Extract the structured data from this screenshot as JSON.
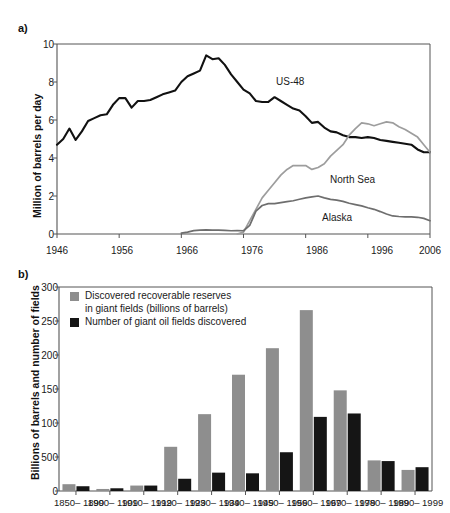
{
  "figure": {
    "panel_a_label": "a)",
    "panel_b_label": "b)"
  },
  "colors": {
    "us48": "#111111",
    "north_sea": "#9d9d9d",
    "alaska": "#6e6e6e",
    "reserves_bar": "#8e8e8e",
    "fields_bar": "#151515",
    "axis": "#555555"
  },
  "chart_data": [
    {
      "type": "line",
      "panel": "a",
      "title": "",
      "xlabel": "",
      "ylabel": "Million of barrels per day",
      "xlim": [
        1946,
        2006
      ],
      "ylim": [
        0,
        10
      ],
      "xticks": [
        1946,
        1956,
        1966,
        1976,
        1986,
        1996,
        2006
      ],
      "yticks": [
        0,
        2,
        4,
        6,
        8,
        10
      ],
      "grid": false,
      "legend_position": "inline-annotations",
      "annotations": [
        {
          "text": "US-48",
          "x": 1988,
          "y": 7.85
        },
        {
          "text": "North Sea",
          "x": 1992,
          "y": 3.45
        },
        {
          "text": "Alaska",
          "x": 1991,
          "y": 1.25
        }
      ],
      "series": [
        {
          "name": "US-48",
          "color": "#111111",
          "x": [
            1946,
            1947,
            1948,
            1949,
            1950,
            1951,
            1952,
            1953,
            1954,
            1955,
            1956,
            1957,
            1958,
            1959,
            1960,
            1961,
            1962,
            1963,
            1964,
            1965,
            1966,
            1967,
            1968,
            1969,
            1970,
            1971,
            1972,
            1973,
            1974,
            1975,
            1976,
            1977,
            1978,
            1979,
            1980,
            1981,
            1982,
            1983,
            1984,
            1985,
            1986,
            1987,
            1988,
            1989,
            1990,
            1991,
            1992,
            1993,
            1994,
            1995,
            1996,
            1997,
            1998,
            1999,
            2000,
            2001,
            2002,
            2003,
            2004,
            2005,
            2006
          ],
          "y": [
            4.7,
            5.0,
            5.55,
            4.95,
            5.4,
            5.95,
            6.1,
            6.25,
            6.3,
            6.8,
            7.15,
            7.15,
            6.65,
            7.0,
            7.0,
            7.05,
            7.2,
            7.35,
            7.45,
            7.55,
            8.0,
            8.3,
            8.45,
            8.6,
            9.4,
            9.2,
            9.25,
            8.9,
            8.4,
            8.0,
            7.6,
            7.4,
            7.0,
            6.95,
            6.95,
            7.2,
            7.0,
            6.8,
            6.6,
            6.5,
            6.2,
            5.85,
            5.9,
            5.6,
            5.4,
            5.35,
            5.2,
            5.1,
            5.1,
            5.05,
            5.1,
            5.05,
            4.95,
            4.9,
            4.85,
            4.8,
            4.75,
            4.7,
            4.45,
            4.3,
            4.3
          ]
        },
        {
          "name": "North Sea",
          "color": "#9d9d9d",
          "x": [
            1975,
            1976,
            1977,
            1978,
            1979,
            1980,
            1981,
            1982,
            1983,
            1984,
            1985,
            1986,
            1987,
            1988,
            1989,
            1990,
            1991,
            1992,
            1993,
            1994,
            1995,
            1996,
            1997,
            1998,
            1999,
            2000,
            2001,
            2002,
            2003,
            2004,
            2005,
            2006
          ],
          "y": [
            0.0,
            0.1,
            0.7,
            1.3,
            1.9,
            2.3,
            2.7,
            3.1,
            3.4,
            3.6,
            3.6,
            3.6,
            3.4,
            3.5,
            3.7,
            4.1,
            4.4,
            4.7,
            5.2,
            5.55,
            5.85,
            5.8,
            5.7,
            5.8,
            5.9,
            5.85,
            5.65,
            5.5,
            5.3,
            5.1,
            4.7,
            4.3
          ]
        },
        {
          "name": "Alaska",
          "color": "#6e6e6e",
          "x": [
            1966,
            1967,
            1968,
            1969,
            1970,
            1971,
            1972,
            1973,
            1974,
            1975,
            1976,
            1977,
            1978,
            1979,
            1980,
            1981,
            1982,
            1983,
            1984,
            1985,
            1986,
            1987,
            1988,
            1989,
            1990,
            1991,
            1992,
            1993,
            1994,
            1995,
            1996,
            1997,
            1998,
            1999,
            2000,
            2001,
            2002,
            2003,
            2004,
            2005,
            2006
          ],
          "y": [
            0.05,
            0.1,
            0.18,
            0.2,
            0.22,
            0.2,
            0.2,
            0.19,
            0.17,
            0.18,
            0.17,
            0.45,
            1.2,
            1.5,
            1.6,
            1.6,
            1.65,
            1.7,
            1.75,
            1.83,
            1.9,
            1.95,
            2.0,
            1.9,
            1.82,
            1.78,
            1.72,
            1.62,
            1.55,
            1.48,
            1.38,
            1.3,
            1.18,
            1.05,
            0.95,
            0.92,
            0.9,
            0.9,
            0.88,
            0.82,
            0.7
          ]
        }
      ]
    },
    {
      "type": "bar",
      "panel": "b",
      "title": "",
      "xlabel": "",
      "ylabel": "Billions of barrels and number of fields",
      "ylim": [
        0,
        300
      ],
      "ytick_labels": [
        "0",
        "500",
        "100",
        "150",
        "200",
        "250",
        "300"
      ],
      "ytick_values": [
        0,
        50,
        100,
        150,
        200,
        250,
        300
      ],
      "grid": false,
      "legend_position": "upper-left-inside",
      "categories": [
        "1850–\n1899",
        "1900–\n1909",
        "1910–\n1919",
        "1920–\n1929",
        "1930–\n1939",
        "1940–\n1949",
        "1950–\n1959",
        "1960–\n1969",
        "1970–\n1979",
        "1980–\n1989",
        "1990–\n1999"
      ],
      "series": [
        {
          "name": "Discovered recoverable reserves\nin giant fields (billions of barrels)",
          "color": "#8e8e8e",
          "values": [
            10,
            3,
            8,
            65,
            113,
            171,
            210,
            266,
            148,
            45,
            31
          ]
        },
        {
          "name": "Number of giant oil fields discovered",
          "color": "#151515",
          "values": [
            7,
            4,
            8,
            18,
            27,
            26,
            57,
            109,
            114,
            44,
            35
          ]
        }
      ]
    }
  ]
}
